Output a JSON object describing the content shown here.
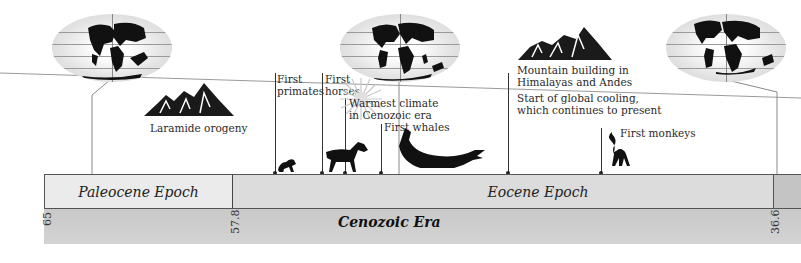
{
  "era": {
    "label": "Cenozoic Era"
  },
  "epochs": [
    {
      "label": "Paleocene Epoch",
      "start_mya": 65,
      "end_mya": 57.8,
      "color": "#ebebeb"
    },
    {
      "label": "Eocene Epoch",
      "start_mya": 57.8,
      "end_mya": 36.6,
      "color": "#dcdcdc"
    },
    {
      "label": "",
      "start_mya": 36.6,
      "end_mya": null,
      "color": "#c4c4c4"
    }
  ],
  "ticks": [
    {
      "label": "65"
    },
    {
      "label": "57.8"
    },
    {
      "label": "36.6"
    }
  ],
  "events": [
    {
      "label": "Laramide orogeny",
      "icon": "mountain-icon"
    },
    {
      "label_lines": [
        "First",
        "primates"
      ],
      "icon": "primate-icon"
    },
    {
      "label_lines": [
        "First",
        "horses"
      ],
      "icon": "horse-icon"
    },
    {
      "label_lines": [
        "Warmest climate",
        "in Cenozoic era"
      ],
      "icon": "sun-burst-icon"
    },
    {
      "label": "First whales",
      "icon": "whale-icon"
    },
    {
      "label_lines": [
        "Mountain building in",
        "Himalayas and Andes"
      ],
      "icon": "mountain-icon"
    },
    {
      "label_lines": [
        "Start of global cooling,",
        "which continues to present"
      ]
    },
    {
      "label": "First monkeys",
      "icon": "monkey-icon"
    }
  ],
  "globes": [
    {
      "name": "paleocene-world-map"
    },
    {
      "name": "eocene-world-map"
    },
    {
      "name": "oligocene-world-map"
    }
  ],
  "colors": {
    "paleocene": "#ebebeb",
    "eocene": "#dcdcdc",
    "era_band": "#cdcdcd",
    "line": "#333333"
  }
}
